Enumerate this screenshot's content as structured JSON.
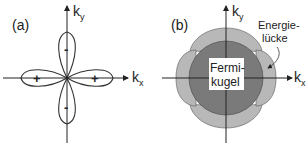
{
  "panel_a": {
    "label": "(a)",
    "axis_x": "k",
    "axis_x_sub": "x",
    "axis_y": "k",
    "axis_y_sub": "y",
    "signs": {
      "left": "+",
      "right": "+",
      "top": "-",
      "bottom": "-"
    }
  },
  "panel_b": {
    "label": "(b)",
    "axis_x": "k",
    "axis_x_sub": "x",
    "axis_y": "k",
    "axis_y_sub": "y",
    "center_label_line1": "Fermi-",
    "center_label_line2": "kugel",
    "annotation_line1": "Energie-",
    "annotation_line2": "lücke",
    "colors": {
      "fermi_sphere": "#7a7a7a",
      "gap_lobes": "#b8b8b8",
      "outline": "#333333"
    }
  }
}
